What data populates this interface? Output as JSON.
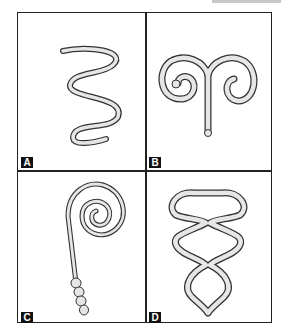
{
  "figure": {
    "panels": [
      {
        "id": "A",
        "label": "A",
        "shape": "wavy-serpentine-worm"
      },
      {
        "id": "B",
        "label": "B",
        "shape": "ram-horn-double-coil"
      },
      {
        "id": "C",
        "label": "C",
        "shape": "spiral-with-beaded-tail"
      },
      {
        "id": "D",
        "label": "D",
        "shape": "stacked-loops-chain"
      }
    ],
    "colors": {
      "border": "#222222",
      "outline": "#333333",
      "fill": "#e6e6e6",
      "label_bg": "#111111"
    }
  }
}
